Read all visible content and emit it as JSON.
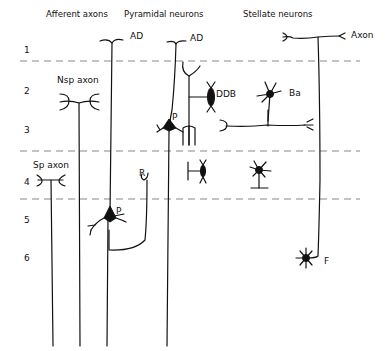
{
  "headers": {
    "afferent": "Afferent axons",
    "pyramidal": "Pyramidal neurons",
    "stellate": "Stellate neurons"
  },
  "layers": [
    "1",
    "2",
    "3",
    "4",
    "5",
    "6"
  ],
  "labels": {
    "ad1": "AD",
    "ad2": "AD",
    "axon": "Axon",
    "nsp": "Nsp axon",
    "sp": "Sp axon",
    "ddb": "DDB",
    "ba": "Ba",
    "p_upper": "P",
    "p_lower": "P",
    "r": "R",
    "f": "F"
  },
  "colors": {
    "ink": "#111111",
    "divider": "#888888",
    "background": "#ffffff"
  }
}
